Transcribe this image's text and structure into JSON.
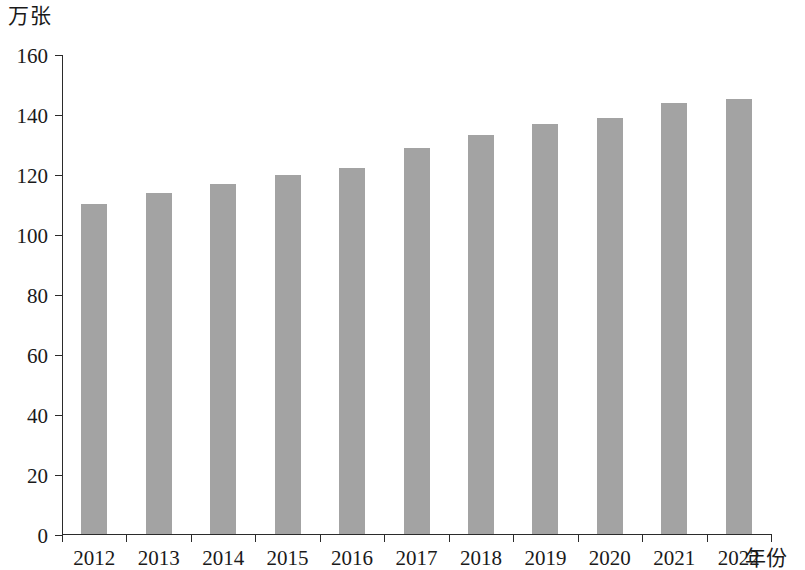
{
  "chart_data": {
    "type": "bar",
    "title": "",
    "subtitle": "",
    "xlabel": "年份",
    "ylabel": "万张",
    "categories": [
      "2012",
      "2013",
      "2014",
      "2015",
      "2016",
      "2017",
      "2018",
      "2019",
      "2020",
      "2021",
      "2022"
    ],
    "values": [
      110,
      113.5,
      116.5,
      119.5,
      122,
      128.5,
      133,
      136.5,
      138.5,
      143.5,
      145
    ],
    "series": [
      {
        "name": "",
        "values": [
          110,
          113.5,
          116.5,
          119.5,
          122,
          128.5,
          133,
          136.5,
          138.5,
          143.5,
          145
        ]
      }
    ],
    "ylim": [
      0,
      160
    ],
    "y_ticks": [
      0,
      20,
      40,
      60,
      80,
      100,
      120,
      140,
      160
    ],
    "y_tick_labels": [
      "0",
      "20",
      "40",
      "60",
      "80",
      "100",
      "120",
      "140",
      "160"
    ],
    "grid": false,
    "legend": null,
    "legend_position": "none",
    "annotations": [],
    "bar_color": "#a3a3a3",
    "axis_color": "#2b2b2b",
    "text_color": "#1a1a1a",
    "background_color": "#ffffff"
  }
}
